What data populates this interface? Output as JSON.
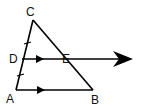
{
  "diagram": {
    "type": "geometry-triangle",
    "points": {
      "A": {
        "label": "A",
        "x": 16,
        "y": 90
      },
      "B": {
        "label": "B",
        "x": 93,
        "y": 90
      },
      "C": {
        "label": "C",
        "x": 33,
        "y": 20
      },
      "D": {
        "label": "D",
        "x": 22,
        "y": 59
      },
      "E": {
        "label": "E",
        "x": 66,
        "y": 59
      }
    },
    "segments": [
      "AC",
      "CB",
      "AB",
      "DE-ray"
    ],
    "marks": {
      "congruent_ticks": [
        "CD",
        "DA"
      ],
      "parallel_arrows": [
        "DE",
        "AB"
      ]
    },
    "stroke_color": "#000000"
  }
}
